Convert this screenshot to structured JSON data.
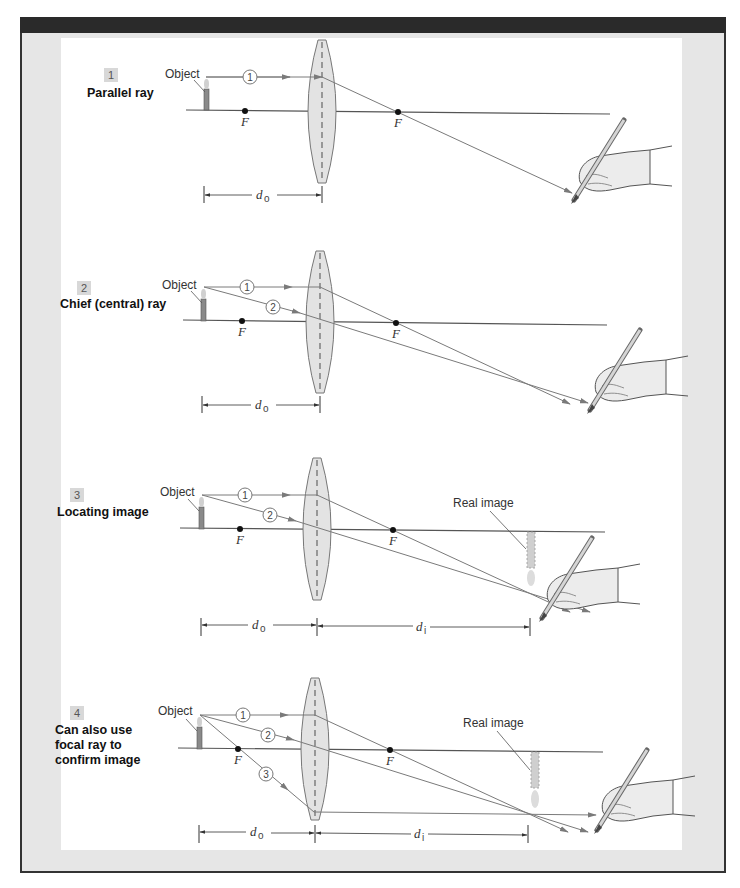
{
  "figure": {
    "colors": {
      "frame": "#e6e6e6",
      "header_bar": "#2a2a2a",
      "lens_fill": "#e3e3e3",
      "ray": "#7a7a7a",
      "axis": "#555555",
      "candle": "#8a8a8a",
      "image_fill": "#cfcfcf"
    },
    "labels": {
      "object": "Object",
      "real_image": "Real image",
      "focal": "F",
      "d_object": "d",
      "d_object_sub": "o",
      "d_image": "d",
      "d_image_sub": "i"
    },
    "panels": [
      {
        "step": "1",
        "title_lines": [
          "Parallel ray"
        ],
        "rays": [
          "1"
        ]
      },
      {
        "step": "2",
        "title_lines": [
          "Chief (central) ray"
        ],
        "rays": [
          "1",
          "2"
        ]
      },
      {
        "step": "3",
        "title_lines": [
          "Locating image"
        ],
        "rays": [
          "1",
          "2"
        ]
      },
      {
        "step": "4",
        "title_lines": [
          "Can also use",
          "focal ray to",
          "confirm image"
        ],
        "rays": [
          "1",
          "2",
          "3"
        ]
      }
    ]
  }
}
